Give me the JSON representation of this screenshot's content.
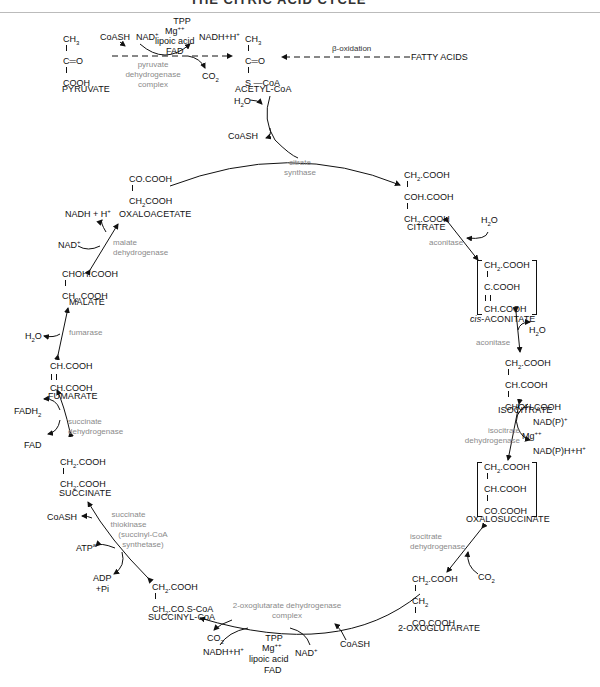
{
  "header": {
    "title": "THE CITRIC ACID CYCLE"
  },
  "entry": {
    "pyruvate": {
      "lines": [
        "CH3",
        "C=O",
        "COOH"
      ],
      "name": "PYRUVATE"
    },
    "acetyl_coa": {
      "lines": [
        "CH3",
        "C=O",
        "S—CoA"
      ],
      "name": "ACETYL-CoA"
    },
    "pdh_cofactors": [
      "TPP",
      "Mg++",
      "lipoic acid",
      "FAD"
    ],
    "pdh_inputs": [
      "CoASH",
      "NAD+"
    ],
    "pdh_outputs": [
      "NADH+H+",
      "CO2"
    ],
    "pdh_enzyme": "pyruvate dehydrogenase complex",
    "beta_oxidation": "β-oxidation",
    "fatty_acids": "FATTY ACIDS",
    "h2o": "H2O",
    "coash": "CoASH"
  },
  "cycle": {
    "citrate_synthase": "citrate synthase",
    "citrate": {
      "lines": [
        "CH2.COOH",
        "COH.COOH",
        "CH2.COOH"
      ],
      "name": "CITRATE"
    },
    "aconitase1": {
      "enzyme": "aconitase",
      "product": "H2O"
    },
    "cis_aconitate": {
      "lines": [
        "CH2.COOH",
        "C.COOH",
        "CH.COOH"
      ],
      "name": "cis-ACONITATE"
    },
    "aconitase2": {
      "enzyme": "aconitase",
      "reactant": "H2O"
    },
    "isocitrate": {
      "lines": [
        "CH2.COOH",
        "CH.COOH",
        "CHOH.COOH"
      ],
      "name": "ISOCITRATE"
    },
    "icdh1": {
      "enzyme": "isocitrate dehydrogenase",
      "inputs": [
        "NAD(P)+"
      ],
      "cofactor": "Mg++",
      "outputs": [
        "NAD(P)H+H+"
      ]
    },
    "oxalosuccinate": {
      "lines": [
        "CH2.COOH",
        "CH.COOH",
        "CO.COOH"
      ],
      "name": "OXALOSUCCINATE"
    },
    "icdh2": {
      "enzyme": "isocitrate dehydrogenase",
      "output": "CO2"
    },
    "oxoglutarate": {
      "lines": [
        "CH2.COOH",
        "CH2",
        "CO.COOH"
      ],
      "name": "2-OXOGLUTARATE"
    },
    "ogdh": {
      "enzyme": "2-oxoglutarate dehydrogenase complex",
      "cofactors": [
        "TPP",
        "Mg++",
        "lipoic acid",
        "FAD"
      ],
      "inputs": [
        "NAD+",
        "CoASH"
      ],
      "outputs": [
        "CO2",
        "NADH+H+"
      ]
    },
    "succinyl_coa": {
      "lines": [
        "CH2.COOH",
        "CH2.CO.S-CoA"
      ],
      "name": "SUCCINYL-CoA"
    },
    "thiokinase": {
      "enzyme": "succinate thiokinase",
      "alt": "(succinyl-CoA synthetase)",
      "inputs": [
        "ADP +Pi"
      ],
      "outputs": [
        "ATPa",
        "CoASH"
      ]
    },
    "succinate": {
      "lines": [
        "CH2.COOH",
        "CH2.COOH"
      ],
      "name": "SUCCINATE"
    },
    "sdh": {
      "enzyme": "succinate dehydrogenase",
      "input": "FAD",
      "output": "FADH2"
    },
    "fumarate": {
      "lines": [
        "CH.COOH",
        "CH.COOH"
      ],
      "name": "FUMARATE"
    },
    "fumarase": {
      "enzyme": "fumarase",
      "reactant": "H2O"
    },
    "malate": {
      "lines": [
        "CHOH.COOH",
        "CH2.COOH"
      ],
      "name": "MALATE"
    },
    "mdh": {
      "enzyme": "malate dehydrogenase",
      "input": "NAD+",
      "output": "NADH + H+"
    },
    "oxaloacetate": {
      "lines": [
        "CO.COOH",
        "CH2COOH"
      ],
      "name": "OXALOACETATE"
    }
  }
}
